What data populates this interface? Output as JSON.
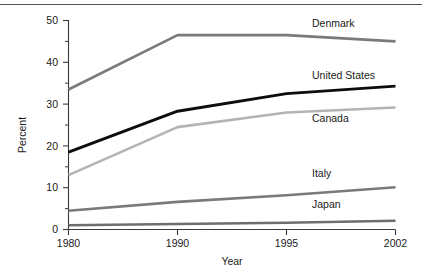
{
  "chart_data": {
    "type": "line",
    "title": "",
    "xlabel": "Year",
    "ylabel": "Percent",
    "categories": [
      "1980",
      "1990",
      "1995",
      "2002"
    ],
    "x": [
      1980,
      1990,
      1995,
      2002
    ],
    "xtick_labels": [
      "1980",
      "1990",
      "1995",
      "2002"
    ],
    "ytick_labels": [
      "0",
      "10",
      "20",
      "30",
      "40",
      "50"
    ],
    "yticks": [
      0,
      10,
      20,
      30,
      40,
      50
    ],
    "yminor_ticks": [
      5,
      15,
      25,
      35,
      45
    ],
    "ylim": [
      0,
      50
    ],
    "grid": false,
    "legend_position": "inline-right-of-series",
    "series": [
      {
        "name": "Denmark",
        "values": [
          33.5,
          46.5,
          46.5,
          45.0
        ],
        "color": "#7a7a7a",
        "width": 2.6
      },
      {
        "name": "United States",
        "values": [
          18.5,
          28.3,
          32.5,
          34.3
        ],
        "color": "#0d0d0d",
        "width": 2.9
      },
      {
        "name": "Canada",
        "values": [
          13.0,
          24.5,
          28.0,
          29.2
        ],
        "color": "#b4b4b4",
        "width": 2.6
      },
      {
        "name": "Italy",
        "values": [
          4.5,
          6.6,
          8.2,
          10.1
        ],
        "color": "#7a7a7a",
        "width": 2.6
      },
      {
        "name": "Japan",
        "values": [
          1.0,
          1.3,
          1.6,
          2.1
        ],
        "color": "#6e6e6e",
        "width": 2.6
      }
    ]
  },
  "labels": {
    "ylabel": "Percent",
    "xlabel": "Year",
    "xtick_1980": "1980",
    "xtick_1990": "1990",
    "xtick_1995": "1995",
    "xtick_2002": "2002",
    "ytick_0": "0",
    "ytick_10": "10",
    "ytick_20": "20",
    "ytick_30": "30",
    "ytick_40": "40",
    "ytick_50": "50",
    "series_denmark": "Denmark",
    "series_united_states": "United States",
    "series_canada": "Canada",
    "series_italy": "Italy",
    "series_japan": "Japan"
  }
}
